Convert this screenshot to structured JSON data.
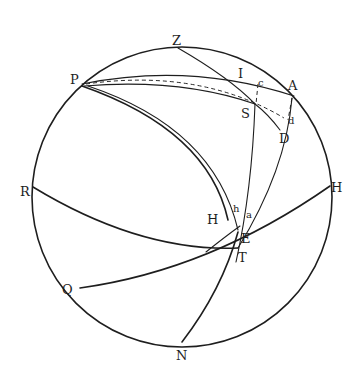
{
  "figure": {
    "type": "spherical-astronomy-diagram",
    "ink_color": "#1e1e1e",
    "background": "#ffffff",
    "labels": {
      "Z": "Z",
      "P": "P",
      "I": "I",
      "A": "A",
      "S": "S",
      "D": "D",
      "R": "R",
      "H_right": "H",
      "H_inner": "H",
      "h": "h",
      "a": "a",
      "E": "E",
      "T": "T",
      "Q": "Q",
      "N": "N",
      "c": "c",
      "d": "d"
    }
  }
}
